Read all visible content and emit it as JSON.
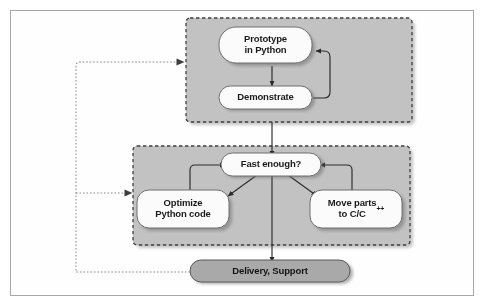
{
  "diagram": {
    "type": "flowchart",
    "colors": {
      "frame_border": "#a8a8a8",
      "cluster_fill": "#c2c2c2",
      "cluster_border": "#4a4a4a",
      "node_fill": "#fbfbfb",
      "node_border": "#6e6e6e",
      "terminal_fill": "#a9a9a9",
      "terminal_border": "#5a5a5a",
      "arrow": "#2b2b2b",
      "feedback_line": "#8a8a8a",
      "shadow": "#7d7d7d",
      "text": "#1a1a1a",
      "background": "#ffffff"
    },
    "clusters": [
      {
        "id": "cluster-prototype",
        "name": "prototype-cluster"
      },
      {
        "id": "cluster-optimize",
        "name": "optimization-cluster"
      }
    ],
    "nodes": [
      {
        "id": "prototype",
        "label": "Prototype\nin Python",
        "shape": "rounded-pill",
        "style": "light"
      },
      {
        "id": "demonstrate",
        "label": "Demonstrate",
        "shape": "rounded-pill",
        "style": "light"
      },
      {
        "id": "fast_enough",
        "label": "Fast enough?",
        "shape": "rounded-pill",
        "style": "light"
      },
      {
        "id": "optimize",
        "label": "Optimize\nPython code",
        "shape": "rounded-pill",
        "style": "light"
      },
      {
        "id": "move_parts",
        "label": "Move parts\nto C/C",
        "label_sup": "++",
        "shape": "rounded-pill",
        "style": "light"
      },
      {
        "id": "delivery",
        "label": "Delivery, Support",
        "shape": "rounded-pill",
        "style": "dark"
      }
    ],
    "edges": [
      {
        "from": "prototype",
        "to": "demonstrate",
        "style": "solid",
        "name": "edge-prototype-to-demonstrate"
      },
      {
        "from": "demonstrate",
        "to": "prototype",
        "style": "solid",
        "name": "edge-demonstrate-loop-back"
      },
      {
        "from": "cluster-prototype",
        "to": "fast_enough",
        "style": "solid",
        "name": "edge-cluster1-to-fast-enough"
      },
      {
        "from": "fast_enough",
        "to": "optimize",
        "style": "solid",
        "name": "edge-fast-enough-to-optimize"
      },
      {
        "from": "fast_enough",
        "to": "move_parts",
        "style": "solid",
        "name": "edge-fast-enough-to-move-parts"
      },
      {
        "from": "fast_enough",
        "to": "delivery",
        "style": "solid",
        "name": "edge-fast-enough-to-delivery"
      },
      {
        "from": "optimize",
        "to": "fast_enough",
        "style": "solid",
        "name": "edge-optimize-loop-back"
      },
      {
        "from": "move_parts",
        "to": "fast_enough",
        "style": "solid",
        "name": "edge-move-parts-loop-back"
      },
      {
        "from": "delivery",
        "to": "cluster-prototype",
        "style": "dotted",
        "name": "feedback-to-prototype-cluster"
      },
      {
        "from": "delivery",
        "to": "cluster-optimize",
        "style": "dotted",
        "name": "feedback-to-optimization-cluster"
      }
    ]
  }
}
